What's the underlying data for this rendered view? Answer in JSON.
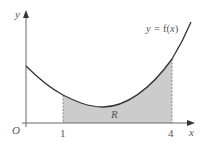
{
  "diagram": {
    "type": "area-under-curve",
    "axes": {
      "x_label": "x",
      "y_label": "y",
      "origin_label": "O"
    },
    "curve": {
      "label_prefix": "y = ",
      "label_func": "f(",
      "label_var": "x",
      "label_close": ")"
    },
    "region": {
      "label": "R",
      "fill": "#cccccc"
    },
    "bounds": {
      "lower": "1",
      "upper": "4"
    },
    "colors": {
      "curve": "#333333",
      "axis": "#555555",
      "shade": "#cccccc",
      "background": "#ffffff"
    }
  }
}
